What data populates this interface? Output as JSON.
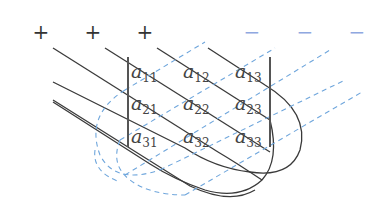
{
  "diagram": {
    "colors": {
      "positive_lines": "#333333",
      "negative_lines": "#6fa6dc",
      "minus_sign": "#8fa8e0",
      "text": "#444444"
    },
    "plus_signs": [
      {
        "label": "+",
        "x": 41,
        "y": 32
      },
      {
        "label": "+",
        "x": 93,
        "y": 32
      },
      {
        "label": "+",
        "x": 145,
        "y": 32
      }
    ],
    "minus_signs": [
      {
        "label": "−",
        "x": 252,
        "y": 32
      },
      {
        "label": "−",
        "x": 305,
        "y": 32
      },
      {
        "label": "−",
        "x": 357,
        "y": 32
      }
    ],
    "matrix": {
      "rows": [
        [
          {
            "base": "a",
            "sub": "11"
          },
          {
            "base": "a",
            "sub": "12"
          },
          {
            "base": "a",
            "sub": "13"
          }
        ],
        [
          {
            "base": "a",
            "sub": "21"
          },
          {
            "base": "a",
            "sub": "22"
          },
          {
            "base": "a",
            "sub": "23"
          }
        ],
        [
          {
            "base": "a",
            "sub": "31"
          },
          {
            "base": "a",
            "sub": "32"
          },
          {
            "base": "a",
            "sub": "33"
          }
        ]
      ]
    }
  }
}
